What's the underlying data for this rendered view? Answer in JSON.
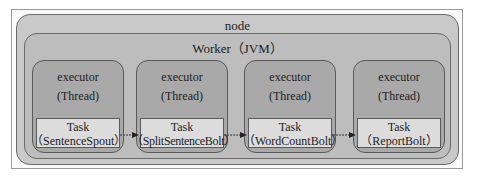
{
  "diagram": {
    "node": {
      "label": "node"
    },
    "worker": {
      "label": "Worker（JVM）"
    },
    "executors": [
      {
        "title": "executor",
        "subtitle": "(Thread)",
        "task_label": "Task",
        "task_name": "（SentenceSpout）"
      },
      {
        "title": "executor",
        "subtitle": "(Thread)",
        "task_label": "Task",
        "task_name": "（SplitSentenceBolt）"
      },
      {
        "title": "executor",
        "subtitle": "(Thread)",
        "task_label": "Task",
        "task_name": "（WordCountBolt）"
      },
      {
        "title": "executor",
        "subtitle": "(Thread)",
        "task_label": "Task",
        "task_name": "（ReportBolt）"
      }
    ],
    "edges": [
      {
        "from": "SentenceSpout",
        "to": "SplitSentenceBolt"
      },
      {
        "from": "SplitSentenceBolt",
        "to": "WordCountBolt"
      },
      {
        "from": "WordCountBolt",
        "to": "ReportBolt"
      }
    ],
    "colors": {
      "node_fill": "#c9c9c9",
      "worker_fill": "#bdbdbd",
      "executor_fill": "#a9a9a9",
      "task_fill": "#dcdcdc",
      "stroke": "#5a5a5a"
    }
  }
}
